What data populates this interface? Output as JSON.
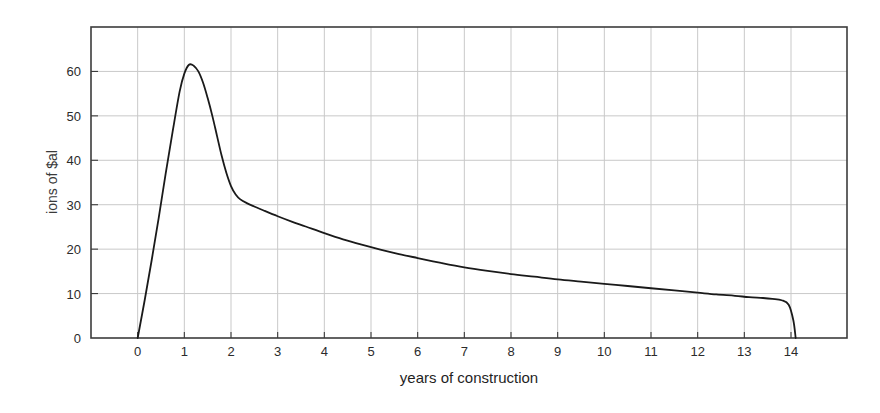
{
  "chart_data": {
    "type": "line",
    "title": "",
    "subtitle": "",
    "xlabel": "years of construction",
    "ylabel": "ions of $al",
    "ylabel_note": "y-axis title is clipped at the left edge of the image; only the right-hand sliver of the rotated text is legible",
    "xlim": [
      -1,
      15.2
    ],
    "ylim": [
      0,
      70
    ],
    "xticks": [
      0,
      1,
      2,
      3,
      4,
      5,
      6,
      7,
      8,
      9,
      10,
      11,
      12,
      13,
      14
    ],
    "xtick_labels": [
      "0",
      "1",
      "2",
      "3",
      "4",
      "5",
      "6",
      "7",
      "8",
      "9",
      "10",
      "11",
      "12",
      "13",
      "14"
    ],
    "yticks": [
      0,
      10,
      20,
      30,
      40,
      50,
      60
    ],
    "ytick_labels": [
      "0",
      "10",
      "20",
      "30",
      "40",
      "50",
      "60"
    ],
    "grid": true,
    "grid_color": "#c9c9c9",
    "legend": null,
    "legend_position": "none",
    "line_color": "#1a1a1a",
    "line_width": 1.8,
    "frame_color": "#3c3c3c",
    "background": "#ffffff",
    "peak": {
      "x": 1.1,
      "y": 61.5
    },
    "end_drop_x": 14.1,
    "series": [
      {
        "name": "spending",
        "x": [
          0,
          0.15,
          0.3,
          0.45,
          0.6,
          0.75,
          0.9,
          1.0,
          1.1,
          1.2,
          1.3,
          1.4,
          1.5,
          1.6,
          1.7,
          1.8,
          1.9,
          2.0,
          2.1,
          2.2,
          2.35,
          2.5,
          2.7,
          3.0,
          3.3,
          3.6,
          4.0,
          4.4,
          4.8,
          5.2,
          5.6,
          6.0,
          6.5,
          7.0,
          7.5,
          8.0,
          8.5,
          9.0,
          9.5,
          10.0,
          10.5,
          11.0,
          11.5,
          12.0,
          12.4,
          12.8,
          13.1,
          13.4,
          13.6,
          13.8,
          13.95,
          14.05,
          14.1
        ],
        "y": [
          0,
          8.5,
          17.5,
          27.0,
          37.0,
          46.5,
          55.5,
          59.5,
          61.5,
          61.3,
          60.0,
          57.5,
          54.0,
          50.0,
          45.5,
          41.0,
          37.2,
          34.2,
          32.3,
          31.2,
          30.3,
          29.6,
          28.7,
          27.4,
          26.2,
          25.1,
          23.6,
          22.2,
          21.0,
          19.9,
          18.9,
          18.0,
          16.9,
          15.9,
          15.1,
          14.4,
          13.8,
          13.2,
          12.7,
          12.2,
          11.7,
          11.2,
          10.7,
          10.2,
          9.8,
          9.5,
          9.2,
          9.0,
          8.8,
          8.5,
          7.5,
          4.0,
          0
        ]
      }
    ]
  },
  "axes": {
    "x_title": "years of construction",
    "y_title_visible_fragment": "ions of $al"
  }
}
